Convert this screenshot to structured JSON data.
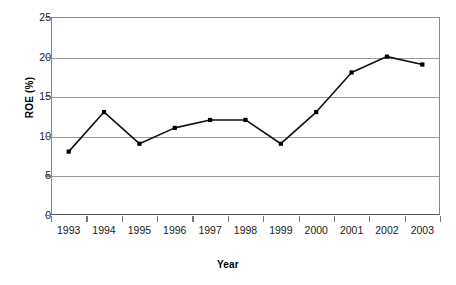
{
  "chart_data": {
    "type": "line",
    "title": "",
    "xlabel": "Year",
    "ylabel": "ROE (%)",
    "categories": [
      "1993",
      "1994",
      "1995",
      "1996",
      "1997",
      "1998",
      "1999",
      "2000",
      "2001",
      "2002",
      "2003"
    ],
    "values": [
      8,
      13,
      9,
      11,
      12,
      12,
      9,
      13,
      18,
      20,
      19
    ],
    "series": [
      {
        "name": "ROE (%)",
        "values": [
          8,
          13,
          9,
          11,
          12,
          12,
          9,
          13,
          18,
          20,
          19
        ]
      }
    ],
    "ylim": [
      0,
      25
    ],
    "y_ticks": [
      0,
      5,
      10,
      15,
      20,
      25
    ],
    "y_tick_labels": [
      "0",
      "5",
      "10",
      "15",
      "20",
      "25"
    ],
    "grid": true,
    "grid_axis": "y",
    "legend": false,
    "legend_position": "none",
    "marker": "square",
    "line_color": "#111111",
    "marker_color": "#000000",
    "grid_color": "#9a9a9a",
    "axis_color": "#555555",
    "background_color": "#ffffff"
  }
}
